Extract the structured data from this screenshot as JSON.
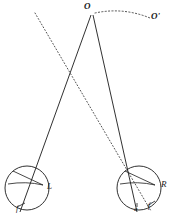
{
  "figure": {
    "type": "geometric-optics-diagram",
    "background_color": "#ffffff",
    "stroke_color": "#1a1a1a",
    "labels": {
      "apex": "O",
      "apex_prime": "Oʹ",
      "left_eye": "L",
      "right_eye": "R",
      "left_fovea": "f",
      "right_point_a": "a",
      "right_fovea": "f"
    },
    "geometry": {
      "apex_point": {
        "x": 92,
        "y": 13
      },
      "apex_prime_point": {
        "x": 152,
        "y": 19
      },
      "dotted_arc": "M 94 14 Q 122 8 151 18",
      "solid_line_left": {
        "x1": 91,
        "y1": 15,
        "x2": 20,
        "y2": 212
      },
      "solid_line_right": {
        "x1": 93,
        "y1": 15,
        "x2": 137,
        "y2": 212
      },
      "dotted_axis": {
        "x1": 35,
        "y1": 13,
        "x2": 151,
        "y2": 211
      },
      "left_circle": {
        "cx": 27,
        "cy": 188,
        "r": 22
      },
      "right_circle": {
        "cx": 139,
        "cy": 188,
        "r": 22
      },
      "left_cornea_arc": "M 12 172 Q 30 180 44 186",
      "right_cornea_arc": "M 124 172 Q 142 180 156 186",
      "left_chord": "M 9 186 Q 26 182 44 186",
      "right_chord": "M 121 186 Q 138 182 156 186"
    }
  }
}
